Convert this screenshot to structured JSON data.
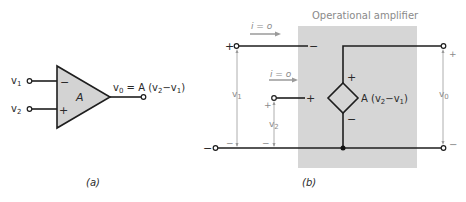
{
  "figure_a": {
    "caption": "(a)",
    "input1_label": "v",
    "input1_sub": "1",
    "input2_label": "v",
    "input2_sub": "2",
    "gain_label": "A",
    "inverting_sign": "−",
    "noninverting_sign": "+",
    "output_eq_lhs": "v",
    "output_eq_lhs_sub": "0",
    "output_eq_mid": " = A (v",
    "output_eq_sub2": "2",
    "output_eq_minus": "−v",
    "output_eq_sub1": "1",
    "output_eq_close": ")"
  },
  "figure_b": {
    "caption": "(b)",
    "box_title": "Operational amplifier",
    "current1_label": "i = o",
    "current2_label": "i = o",
    "v1_label": "v",
    "v1_sub": "1",
    "v2_label": "v",
    "v2_sub": "2",
    "v0_label": "v",
    "v0_sub": "0",
    "plus": "+",
    "minus": "−",
    "source_label_a": "A (v",
    "source_sub2": "2",
    "source_minus": "−v",
    "source_sub1": "1",
    "source_close": ")"
  },
  "colors": {
    "box_fill": "#d6d6d6",
    "triangle_fill": "#d3d3d3",
    "wire": "#1e1e1e",
    "arrow": "#9a9a9a"
  }
}
